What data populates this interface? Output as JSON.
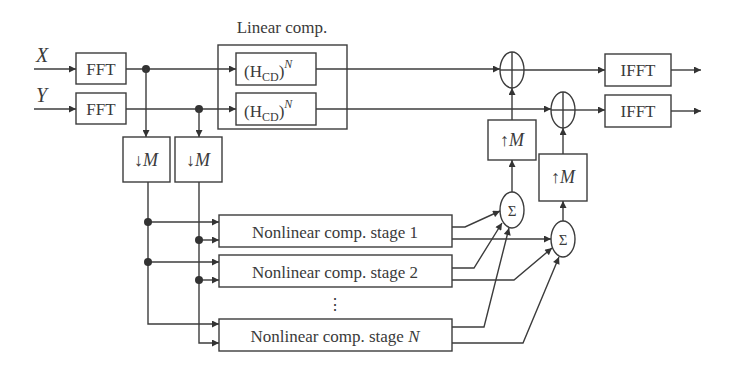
{
  "diagram": {
    "inputs": {
      "x_label": "X",
      "y_label": "Y"
    },
    "fft_blocks": [
      {
        "label": "FFT"
      },
      {
        "label": "FFT"
      }
    ],
    "linear_comp": {
      "title": "Linear comp.",
      "blocks": [
        {
          "prefix": "(H",
          "subscript": "CD",
          "suffix": ")",
          "superscript": "N"
        },
        {
          "prefix": "(H",
          "subscript": "CD",
          "suffix": ")",
          "superscript": "N"
        }
      ]
    },
    "downsample_blocks": [
      {
        "arrow": "↓",
        "label": "M"
      },
      {
        "arrow": "↓",
        "label": "M"
      }
    ],
    "nonlinear_stages": [
      {
        "label": "Nonlinear comp. stage ",
        "index": "1"
      },
      {
        "label": "Nonlinear comp. stage ",
        "index": "2"
      },
      {
        "label": "Nonlinear comp. stage ",
        "index": "N"
      }
    ],
    "ellipsis": "⋮",
    "summers": [
      {
        "symbol": "Σ"
      },
      {
        "symbol": "Σ"
      }
    ],
    "upsample_blocks": [
      {
        "arrow": "↑",
        "label": "M"
      },
      {
        "arrow": "↑",
        "label": "M"
      }
    ],
    "adders": [
      {
        "symbol": "⊕"
      },
      {
        "symbol": "⊕"
      }
    ],
    "ifft_blocks": [
      {
        "label": "IFFT"
      },
      {
        "label": "IFFT"
      }
    ],
    "colors": {
      "stroke": "#3c3c3c",
      "text": "#3a3a3a",
      "background": "#ffffff"
    }
  }
}
